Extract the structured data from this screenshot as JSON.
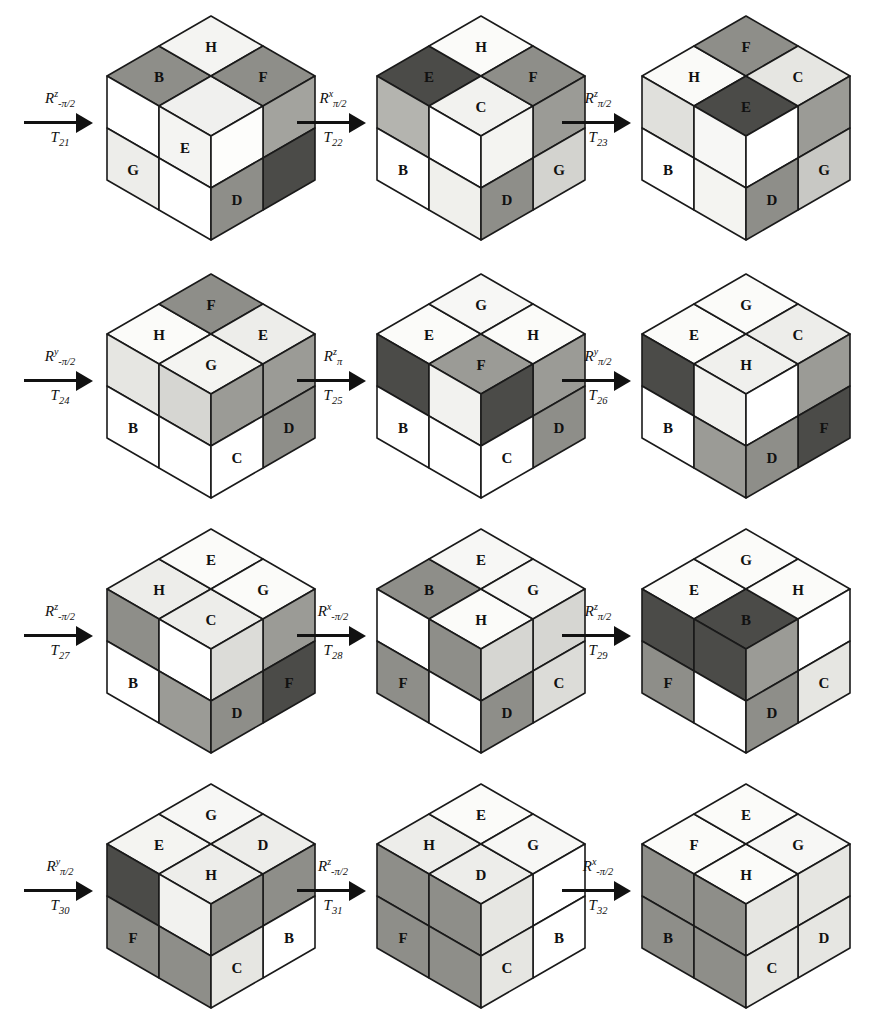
{
  "figure": {
    "rows": 4,
    "cols": 3,
    "palette": {
      "white": "#ffffff",
      "near_white": "#f6f6f4",
      "light": "#e3e3e0",
      "light_gray": "#d6d6d2",
      "mid_gray": "#a9a9a4",
      "gray": "#9b9b96",
      "dark_gray": "#6e6e6a",
      "darker": "#545450",
      "darkest": "#3d3d3a",
      "outline": "#1a1a1a"
    }
  },
  "arrows": [
    {
      "id": "arrow-T21",
      "rot_base": "R",
      "rot_sup": "z",
      "rot_sub": "-π/2",
      "label_bottom": "T",
      "label_bottom_sub": "21"
    },
    {
      "id": "arrow-T22",
      "rot_base": "R",
      "rot_sup": "x",
      "rot_sub": "π/2",
      "label_bottom": "T",
      "label_bottom_sub": "22"
    },
    {
      "id": "arrow-T23",
      "rot_base": "R",
      "rot_sup": "z",
      "rot_sub": "π/2",
      "label_bottom": "T",
      "label_bottom_sub": "23"
    },
    {
      "id": "arrow-T24",
      "rot_base": "R",
      "rot_sup": "y",
      "rot_sub": "-π/2",
      "label_bottom": "T",
      "label_bottom_sub": "24"
    },
    {
      "id": "arrow-T25",
      "rot_base": "R",
      "rot_sup": "z",
      "rot_sub": "π",
      "label_bottom": "T",
      "label_bottom_sub": "25"
    },
    {
      "id": "arrow-T26",
      "rot_base": "R",
      "rot_sup": "y",
      "rot_sub": "π/2",
      "label_bottom": "T",
      "label_bottom_sub": "26"
    },
    {
      "id": "arrow-T27",
      "rot_base": "R",
      "rot_sup": "z",
      "rot_sub": "-π/2",
      "label_bottom": "T",
      "label_bottom_sub": "27"
    },
    {
      "id": "arrow-T28",
      "rot_base": "R",
      "rot_sup": "x",
      "rot_sub": "-π/2",
      "label_bottom": "T",
      "label_bottom_sub": "28"
    },
    {
      "id": "arrow-T29",
      "rot_base": "R",
      "rot_sup": "z",
      "rot_sub": "π/2",
      "label_bottom": "T",
      "label_bottom_sub": "29"
    },
    {
      "id": "arrow-T30",
      "rot_base": "R",
      "rot_sup": "y",
      "rot_sub": "π/2",
      "label_bottom": "T",
      "label_bottom_sub": "30"
    },
    {
      "id": "arrow-T31",
      "rot_base": "R",
      "rot_sup": "z",
      "rot_sub": "-π/2",
      "label_bottom": "T",
      "label_bottom_sub": "31"
    },
    {
      "id": "arrow-T32",
      "rot_base": "R",
      "rot_sup": "x",
      "rot_sub": "-π/2",
      "label_bottom": "T",
      "label_bottom_sub": "32"
    }
  ],
  "cubes": [
    {
      "id": "cube-1",
      "after": "T21",
      "top": [
        {
          "label": "B",
          "color": "#8e8e89"
        },
        {
          "label": "H",
          "color": "#f4f4f2"
        },
        {
          "label": "",
          "color": "#f0f0ee"
        },
        {
          "label": "F",
          "color": "#8e8e89"
        }
      ],
      "left": [
        {
          "label": "",
          "color": "#ffffff"
        },
        {
          "label": "E",
          "color": "#f4f4f2"
        },
        {
          "label": "G",
          "color": "#ededea"
        },
        {
          "label": "",
          "color": "#ffffff"
        }
      ],
      "right": [
        {
          "label": "",
          "color": "#a3a39e"
        },
        {
          "label": "",
          "color": "#fdfdfb"
        },
        {
          "label": "",
          "color": "#4b4b48"
        },
        {
          "label": "D",
          "color": "#8e8e89"
        }
      ],
      "bottom_right": [
        {
          "label": "C",
          "color": "#e0e0dc"
        }
      ]
    },
    {
      "id": "cube-2",
      "after": "T22",
      "top": [
        {
          "label": "E",
          "color": "#4b4b48"
        },
        {
          "label": "H",
          "color": "#fbfbf9"
        },
        {
          "label": "C",
          "color": "#f2f2ef"
        },
        {
          "label": "F",
          "color": "#8e8e89"
        }
      ],
      "left": [
        {
          "label": "",
          "color": "#b4b4af"
        },
        {
          "label": "",
          "color": "#ffffff"
        },
        {
          "label": "B",
          "color": "#ffffff"
        },
        {
          "label": "",
          "color": "#f0f0ec"
        }
      ],
      "right": [
        {
          "label": "",
          "color": "#9b9b96"
        },
        {
          "label": "",
          "color": "#f4f4f1"
        },
        {
          "label": "G",
          "color": "#d3d3cf"
        },
        {
          "label": "D",
          "color": "#8e8e89"
        }
      ]
    },
    {
      "id": "cube-3",
      "after": "T23",
      "top": [
        {
          "label": "H",
          "color": "#fafaf8"
        },
        {
          "label": "F",
          "color": "#8e8e89"
        },
        {
          "label": "E",
          "color": "#4b4b48"
        },
        {
          "label": "C",
          "color": "#e6e6e2"
        }
      ],
      "left": [
        {
          "label": "",
          "color": "#e0e0dc"
        },
        {
          "label": "",
          "color": "#f7f7f5"
        },
        {
          "label": "B",
          "color": "#ffffff"
        },
        {
          "label": "",
          "color": "#f4f4f1"
        }
      ],
      "right": [
        {
          "label": "",
          "color": "#9b9b96"
        },
        {
          "label": "",
          "color": "#ffffff"
        },
        {
          "label": "G",
          "color": "#c8c8c4"
        },
        {
          "label": "D",
          "color": "#8e8e89"
        }
      ]
    },
    {
      "id": "cube-4",
      "after": "T24",
      "top": [
        {
          "label": "H",
          "color": "#fbfbf9"
        },
        {
          "label": "F",
          "color": "#8e8e89"
        },
        {
          "label": "G",
          "color": "#f4f4f1"
        },
        {
          "label": "E",
          "color": "#ededea"
        }
      ],
      "left": [
        {
          "label": "",
          "color": "#e6e6e2"
        },
        {
          "label": "",
          "color": "#d6d6d2"
        },
        {
          "label": "B",
          "color": "#ffffff"
        },
        {
          "label": "",
          "color": "#ffffff"
        }
      ],
      "right": [
        {
          "label": "",
          "color": "#9b9b96"
        },
        {
          "label": "",
          "color": "#9b9b96"
        },
        {
          "label": "D",
          "color": "#8e8e89"
        },
        {
          "label": "C",
          "color": "#ffffff"
        }
      ]
    },
    {
      "id": "cube-5",
      "after": "T25",
      "top": [
        {
          "label": "E",
          "color": "#fbfbf9"
        },
        {
          "label": "G",
          "color": "#f7f7f5"
        },
        {
          "label": "F",
          "color": "#9b9b96"
        },
        {
          "label": "H",
          "color": "#fbfbf9"
        }
      ],
      "left": [
        {
          "label": "",
          "color": "#4b4b48"
        },
        {
          "label": "",
          "color": "#f2f2ef"
        },
        {
          "label": "B",
          "color": "#ffffff"
        },
        {
          "label": "",
          "color": "#ffffff"
        }
      ],
      "right": [
        {
          "label": "",
          "color": "#9b9b96"
        },
        {
          "label": "",
          "color": "#4b4b48"
        },
        {
          "label": "D",
          "color": "#8e8e89"
        },
        {
          "label": "C",
          "color": "#ffffff"
        }
      ]
    },
    {
      "id": "cube-6",
      "after": "T26",
      "top": [
        {
          "label": "E",
          "color": "#fbfbf9"
        },
        {
          "label": "G",
          "color": "#fbfbf9"
        },
        {
          "label": "H",
          "color": "#f0f0ed"
        },
        {
          "label": "C",
          "color": "#ededea"
        }
      ],
      "left": [
        {
          "label": "",
          "color": "#4b4b48"
        },
        {
          "label": "",
          "color": "#f2f2ef"
        },
        {
          "label": "B",
          "color": "#ffffff"
        },
        {
          "label": "",
          "color": "#9b9b96"
        }
      ],
      "right": [
        {
          "label": "",
          "color": "#9b9b96"
        },
        {
          "label": "",
          "color": "#ffffff"
        },
        {
          "label": "F",
          "color": "#4b4b48"
        },
        {
          "label": "D",
          "color": "#8e8e89"
        }
      ]
    },
    {
      "id": "cube-7",
      "after": "T27",
      "top": [
        {
          "label": "H",
          "color": "#ededea"
        },
        {
          "label": "E",
          "color": "#fbfbf9"
        },
        {
          "label": "C",
          "color": "#ededea"
        },
        {
          "label": "G",
          "color": "#fbfbf9"
        }
      ],
      "left": [
        {
          "label": "",
          "color": "#8e8e89"
        },
        {
          "label": "",
          "color": "#ffffff"
        },
        {
          "label": "B",
          "color": "#ffffff"
        },
        {
          "label": "",
          "color": "#9b9b96"
        }
      ],
      "right": [
        {
          "label": "",
          "color": "#9b9b96"
        },
        {
          "label": "",
          "color": "#dcdcd8"
        },
        {
          "label": "F",
          "color": "#4b4b48"
        },
        {
          "label": "D",
          "color": "#8e8e89"
        }
      ]
    },
    {
      "id": "cube-8",
      "after": "T28",
      "top": [
        {
          "label": "B",
          "color": "#8e8e89"
        },
        {
          "label": "E",
          "color": "#f7f7f5"
        },
        {
          "label": "H",
          "color": "#fbfbf9"
        },
        {
          "label": "G",
          "color": "#f7f7f5"
        }
      ],
      "left": [
        {
          "label": "",
          "color": "#ffffff"
        },
        {
          "label": "",
          "color": "#8e8e89"
        },
        {
          "label": "F",
          "color": "#8e8e89"
        },
        {
          "label": "",
          "color": "#ffffff"
        }
      ],
      "right": [
        {
          "label": "",
          "color": "#d6d6d2"
        },
        {
          "label": "",
          "color": "#d6d6d2"
        },
        {
          "label": "C",
          "color": "#dcdcd8"
        },
        {
          "label": "D",
          "color": "#8e8e89"
        }
      ]
    },
    {
      "id": "cube-9",
      "after": "T29",
      "top": [
        {
          "label": "E",
          "color": "#fbfbf9"
        },
        {
          "label": "G",
          "color": "#fbfbf9"
        },
        {
          "label": "B",
          "color": "#4b4b48"
        },
        {
          "label": "H",
          "color": "#fbfbf9"
        }
      ],
      "left": [
        {
          "label": "",
          "color": "#4b4b48"
        },
        {
          "label": "",
          "color": "#4b4b48"
        },
        {
          "label": "F",
          "color": "#8e8e89"
        },
        {
          "label": "",
          "color": "#ffffff"
        }
      ],
      "right": [
        {
          "label": "",
          "color": "#ffffff"
        },
        {
          "label": "",
          "color": "#9b9b96"
        },
        {
          "label": "C",
          "color": "#e6e6e2"
        },
        {
          "label": "D",
          "color": "#8e8e89"
        }
      ]
    },
    {
      "id": "cube-10",
      "after": "T30",
      "top": [
        {
          "label": "E",
          "color": "#f4f4f1"
        },
        {
          "label": "G",
          "color": "#f7f7f5"
        },
        {
          "label": "H",
          "color": "#ededea"
        },
        {
          "label": "D",
          "color": "#ededea"
        }
      ],
      "left": [
        {
          "label": "",
          "color": "#4b4b48"
        },
        {
          "label": "",
          "color": "#f2f2ef"
        },
        {
          "label": "F",
          "color": "#8e8e89"
        },
        {
          "label": "",
          "color": "#8e8e89"
        }
      ],
      "right": [
        {
          "label": "",
          "color": "#8e8e89"
        },
        {
          "label": "",
          "color": "#8e8e89"
        },
        {
          "label": "B",
          "color": "#ffffff"
        },
        {
          "label": "C",
          "color": "#e6e6e2"
        }
      ]
    },
    {
      "id": "cube-11",
      "after": "T31",
      "top": [
        {
          "label": "H",
          "color": "#ededea"
        },
        {
          "label": "E",
          "color": "#fbfbf9"
        },
        {
          "label": "D",
          "color": "#ededea"
        },
        {
          "label": "G",
          "color": "#f7f7f5"
        }
      ],
      "left": [
        {
          "label": "",
          "color": "#8e8e89"
        },
        {
          "label": "",
          "color": "#8e8e89"
        },
        {
          "label": "F",
          "color": "#8e8e89"
        },
        {
          "label": "",
          "color": "#8e8e89"
        }
      ],
      "right": [
        {
          "label": "",
          "color": "#ffffff"
        },
        {
          "label": "",
          "color": "#e6e6e2"
        },
        {
          "label": "B",
          "color": "#ffffff"
        },
        {
          "label": "C",
          "color": "#e6e6e2"
        }
      ]
    },
    {
      "id": "cube-12",
      "after": "T32",
      "top": [
        {
          "label": "F",
          "color": "#fbfbf9"
        },
        {
          "label": "E",
          "color": "#fbfbf9"
        },
        {
          "label": "H",
          "color": "#fbfbf9"
        },
        {
          "label": "G",
          "color": "#f7f7f5"
        }
      ],
      "left": [
        {
          "label": "",
          "color": "#8e8e89"
        },
        {
          "label": "",
          "color": "#8e8e89"
        },
        {
          "label": "B",
          "color": "#8e8e89"
        },
        {
          "label": "",
          "color": "#8e8e89"
        }
      ],
      "right": [
        {
          "label": "",
          "color": "#e6e6e2"
        },
        {
          "label": "",
          "color": "#e6e6e2"
        },
        {
          "label": "D",
          "color": "#e6e6e2"
        },
        {
          "label": "C",
          "color": "#e6e6e2"
        }
      ]
    }
  ]
}
